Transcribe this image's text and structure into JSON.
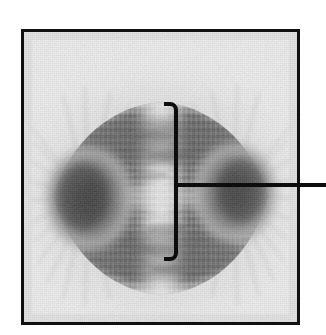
{
  "figure": {
    "kind": "micrograph",
    "caption_text": "",
    "subject": "mitotic spindle at metaphase",
    "background_color": "#ffffff"
  },
  "micrograph": {
    "name": "spindle-micrograph",
    "alt_text": "Grayscale micrograph of a mitotic spindle at metaphase showing two dark spindle poles (asters) at left and right, radiating microtubule fibers, and a pale vertical metaphase plate at the center",
    "frame": {
      "border_color": "#111111",
      "border_width_px": 3,
      "x": 21,
      "y": 29,
      "width": 279,
      "height": 296
    },
    "tone": {
      "paper": "#ececec",
      "mid_gray": "#9a9a9a",
      "dark_gray": "#5c5c5c",
      "pole_dark": "#3f3f3f",
      "plate_light": "#dcdcdc"
    },
    "features": [
      {
        "name": "left-spindle-pole",
        "label": "left pole (aster)",
        "cx": 72,
        "cy": 172
      },
      {
        "name": "right-spindle-pole",
        "label": "right pole (aster)",
        "cx": 252,
        "cy": 168
      },
      {
        "name": "metaphase-plate",
        "label": "metaphase plate",
        "cx": 160,
        "cy": 178
      },
      {
        "name": "spindle-fibers",
        "label": "spindle fibers (microtubules)",
        "cx": 160,
        "cy": 178
      }
    ]
  },
  "annotation": {
    "name": "metaphase-plate-bracket",
    "label_text": "",
    "color": "#0d0d0d",
    "stroke_width_px": 4,
    "bracket": {
      "x": 176,
      "top_y": 104,
      "bottom_y": 259,
      "tick_length_px": 12,
      "corner_radius_px": 6,
      "tick_direction": "left"
    },
    "leader_line": {
      "name": "leader-line",
      "y": 185,
      "x_start": 176,
      "x_end": 326
    }
  }
}
